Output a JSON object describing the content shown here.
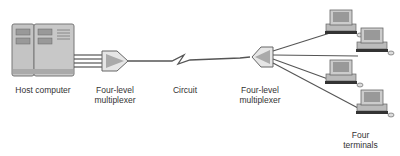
{
  "labels": {
    "host": "Host computer",
    "mux_left": "Four-level\nmultiplexer",
    "circuit": "Circuit",
    "mux_right": "Four-level\nmultiplexer",
    "terminals": "Four\nterminals"
  },
  "colors": {
    "line": "#555555",
    "device_fill": "#c8c8c8",
    "device_stroke": "#777777",
    "mux_fill": "#e6e6e6",
    "mux_inner": "#aaaaaa"
  },
  "terminal_count": 4
}
